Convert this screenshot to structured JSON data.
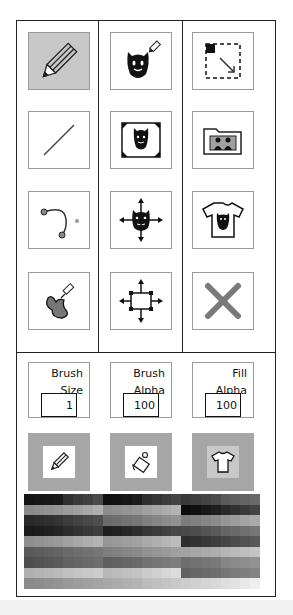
{
  "tools": [
    {
      "id": "pencil",
      "icon": "pencil-icon",
      "selected": true
    },
    {
      "id": "stamp-draw",
      "icon": "mask-pencil-icon",
      "selected": false
    },
    {
      "id": "select-region",
      "icon": "select-resize-icon",
      "selected": false
    },
    {
      "id": "line",
      "icon": "line-icon",
      "selected": false
    },
    {
      "id": "crop-image",
      "icon": "mask-frame-icon",
      "selected": false
    },
    {
      "id": "open-folder",
      "icon": "folder-people-icon",
      "selected": false
    },
    {
      "id": "curve",
      "icon": "bezier-curve-icon",
      "selected": false
    },
    {
      "id": "move-image",
      "icon": "mask-move-icon",
      "selected": false
    },
    {
      "id": "shirt-preview",
      "icon": "tshirt-mask-icon",
      "selected": false
    },
    {
      "id": "fill",
      "icon": "paint-fill-icon",
      "selected": false
    },
    {
      "id": "move-selection",
      "icon": "box-move-icon",
      "selected": false
    },
    {
      "id": "clear",
      "icon": "close-x-icon",
      "selected": false
    }
  ],
  "settings": {
    "brush_size": {
      "label": "Brush\nSize",
      "value": "1"
    },
    "brush_alpha": {
      "label": "Brush\nAlpha",
      "value": "100"
    },
    "fill_alpha": {
      "label": "Fill\nAlpha",
      "value": "100"
    }
  },
  "color_targets": [
    {
      "id": "brush-color",
      "icon": "pencil-icon",
      "swatch": "#ffffff"
    },
    {
      "id": "fill-color",
      "icon": "paint-bucket-icon",
      "swatch": "#ffffff"
    },
    {
      "id": "shirt-color",
      "icon": "tshirt-icon",
      "swatch": "#c8c8c8"
    }
  ],
  "colors": {
    "panel_border": "#222222",
    "tool_border": "#9a9a9a",
    "selected_tool_bg": "#c8c8c8",
    "color_button_bg": "#a6a6a6",
    "x_icon": "#7a7a7a"
  },
  "palette": {
    "rows": [
      [
        "#141414",
        "#161616",
        "#181818",
        "#1a1a1a",
        "#303030",
        "#3a3a3a",
        "#404040",
        "#4a4a4a",
        "#101010",
        "#121212",
        "#161616",
        "#1c1c1c",
        "#2e2e2e",
        "#343434",
        "#3c3c3c",
        "#444444",
        "#3a3a3a",
        "#3e3e3e",
        "#444444",
        "#4a4a4a",
        "#5a5a5a",
        "#5e5e5e",
        "#646464",
        "#6a6a6a"
      ],
      [
        "#8a8a8a",
        "#8e8e8e",
        "#929292",
        "#969696",
        "#9a9a9a",
        "#a0a0a0",
        "#a8a8a8",
        "#b0b0b0",
        "#8c8c8c",
        "#909090",
        "#949494",
        "#989898",
        "#a0a0a0",
        "#a6a6a6",
        "#acacac",
        "#b4b4b4",
        "#0c0c0c",
        "#101010",
        "#181818",
        "#202020",
        "#2a2a2a",
        "#323232",
        "#3a3a3a",
        "#444444"
      ],
      [
        "#2a2a2a",
        "#2c2c2c",
        "#303030",
        "#343434",
        "#3c3c3c",
        "#424242",
        "#484848",
        "#4e4e4e",
        "#6a6a6a",
        "#6e6e6e",
        "#727272",
        "#767676",
        "#808080",
        "#868686",
        "#8c8c8c",
        "#929292",
        "#7c7c7c",
        "#808080",
        "#868686",
        "#8c8c8c",
        "#969696",
        "#9c9c9c",
        "#a4a4a4",
        "#aaaaaa"
      ],
      [
        "#1a1a1a",
        "#1c1c1c",
        "#202020",
        "#242424",
        "#2c2c2c",
        "#323232",
        "#383838",
        "#3e3e3e",
        "#1e1e1e",
        "#222222",
        "#282828",
        "#2e2e2e",
        "#363636",
        "#3c3c3c",
        "#424242",
        "#484848",
        "#4a4a4a",
        "#4e4e4e",
        "#545454",
        "#5a5a5a",
        "#646464",
        "#6a6a6a",
        "#707070",
        "#767676"
      ],
      [
        "#8e8e8e",
        "#929292",
        "#969696",
        "#9a9a9a",
        "#a2a2a2",
        "#a8a8a8",
        "#aeaeae",
        "#b4b4b4",
        "#969696",
        "#9a9a9a",
        "#9e9e9e",
        "#a2a2a2",
        "#aaaaaa",
        "#b0b0b0",
        "#b6b6b6",
        "#bcbcbc",
        "#2e2e2e",
        "#323232",
        "#383838",
        "#3e3e3e",
        "#464646",
        "#4c4c4c",
        "#525252",
        "#585858"
      ],
      [
        "#5a5a5a",
        "#5c5c5c",
        "#606060",
        "#646464",
        "#6a6a6a",
        "#6e6e6e",
        "#727272",
        "#767676",
        "#7e7e7e",
        "#828282",
        "#868686",
        "#8a8a8a",
        "#929292",
        "#969696",
        "#9a9a9a",
        "#a0a0a0",
        "#a2a2a2",
        "#a6a6a6",
        "#aaaaaa",
        "#aeaeae",
        "#b6b6b6",
        "#bababa",
        "#bebebe",
        "#c4c4c4"
      ],
      [
        "#4e4e4e",
        "#525252",
        "#565656",
        "#5a5a5a",
        "#626262",
        "#666666",
        "#6a6a6a",
        "#6e6e6e",
        "#5e5e5e",
        "#626262",
        "#666666",
        "#6a6a6a",
        "#727272",
        "#767676",
        "#7a7a7a",
        "#7e7e7e",
        "#6e6e6e",
        "#727272",
        "#767676",
        "#7a7a7a",
        "#868686",
        "#8a8a8a",
        "#8e8e8e",
        "#929292"
      ],
      [
        "#b0b0b0",
        "#b2b2b2",
        "#b6b6b6",
        "#bababa",
        "#c0c0c0",
        "#c4c4c4",
        "#c8c8c8",
        "#cccccc",
        "#b8b8b8",
        "#bcbcbc",
        "#c0c0c0",
        "#c4c4c4",
        "#cccccc",
        "#d0d0d0",
        "#d6d6d6",
        "#dcdcdc",
        "#626262",
        "#666666",
        "#6a6a6a",
        "#6e6e6e",
        "#767676",
        "#7a7a7a",
        "#7e7e7e",
        "#828282"
      ],
      [
        "#8a8a8a",
        "#8c8c8c",
        "#909090",
        "#949494",
        "#989898",
        "#9c9c9c",
        "#a0a0a0",
        "#a4a4a4",
        "#a8a8a8",
        "#acacac",
        "#b0b0b0",
        "#b4b4b4",
        "#bcbcbc",
        "#c0c0c0",
        "#c4c4c4",
        "#c8c8c8",
        "#cccccc",
        "#d0d0d0",
        "#d4d4d4",
        "#d8d8d8",
        "#dedede",
        "#e2e2e2",
        "#e8e8e8",
        "#eeeeee"
      ]
    ]
  }
}
